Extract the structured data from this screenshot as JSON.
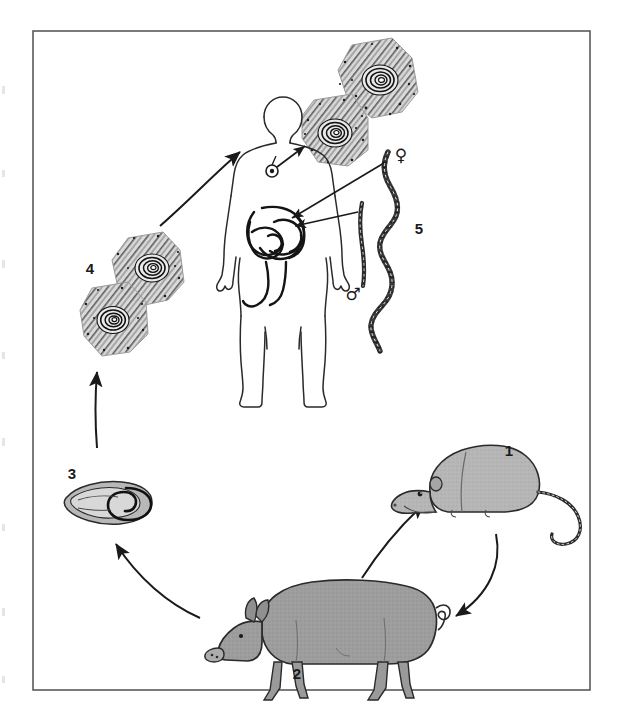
{
  "figure": {
    "kind": "parasite-life-cycle-diagram",
    "border_color": "#555555",
    "background": "#ffffff"
  },
  "labels": {
    "one": "1",
    "two": "2",
    "three": "3",
    "four": "4",
    "five": "5",
    "female_symbol": "♀",
    "male_symbol": "♂"
  },
  "stages": [
    {
      "number": "1",
      "name": "rat",
      "description": "Rat (reservoir host) harbouring encysted larvae in its muscles",
      "x": 500,
      "y": 450,
      "fill": "#b3b3b3"
    },
    {
      "number": "2",
      "name": "pig",
      "description": "Pig infected by eating infected rat or raw meat scraps",
      "x": 300,
      "y": 672,
      "fill": "#9d9d9d"
    },
    {
      "number": "3",
      "name": "encysted-larva",
      "description": "Encysted larva (cyst) in striated muscle of pig",
      "x": 70,
      "y": 473,
      "fill": "#a8a8a8"
    },
    {
      "number": "4",
      "name": "infected-muscle-tissue",
      "description": "Section of infected muscle containing coiled larvae, eaten in undercooked pork",
      "x": 88,
      "y": 268,
      "fill": "#9a9a9a"
    },
    {
      "number": "5",
      "name": "adult-worms",
      "description": "Adult male and female Trichinella worms in the human small intestine",
      "x": 418,
      "y": 228,
      "fill": "#444444"
    }
  ],
  "hosts": {
    "human": {
      "name": "human",
      "organ_intestine": "small intestine",
      "organ_muscle": "striated muscle"
    }
  },
  "arrows": [
    {
      "name": "muscle-to-human",
      "from": "infected-muscle-tissue",
      "to": "human"
    },
    {
      "name": "human-muscle-to-cysts",
      "from": "human-muscle",
      "to": "tissue-cysts"
    },
    {
      "name": "cyst-to-muscle",
      "from": "encysted-larva",
      "to": "infected-muscle-tissue"
    },
    {
      "name": "pig-to-cyst",
      "from": "pig",
      "to": "encysted-larva"
    },
    {
      "name": "pig-to-rat",
      "from": "pig",
      "to": "rat"
    },
    {
      "name": "rat-to-pig",
      "from": "rat",
      "to": "pig"
    },
    {
      "name": "worms-to-intestine-female",
      "from": "female-worm",
      "to": "intestine"
    },
    {
      "name": "worms-to-intestine-male",
      "from": "male-worm",
      "to": "intestine"
    }
  ]
}
